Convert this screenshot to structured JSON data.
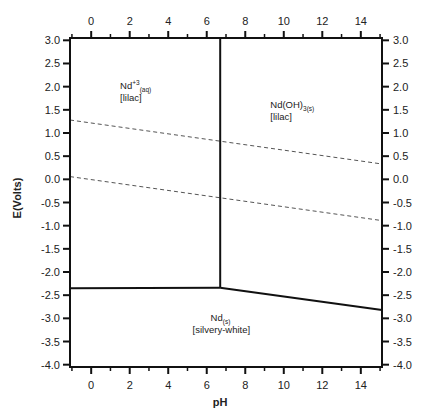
{
  "chart_data": {
    "type": "line",
    "title": "",
    "subtitle": "Pourbaix diagram for neodymium",
    "xlabel": "pH",
    "ylabel": "E(Volts)",
    "xlim": [
      -1.1,
      15.1
    ],
    "ylim": [
      -4.05,
      3.05
    ],
    "grid": false,
    "legend": null,
    "x_ticks": [
      0,
      2,
      4,
      6,
      8,
      10,
      12,
      14
    ],
    "x_tick_labels": [
      "0",
      "2",
      "4",
      "6",
      "8",
      "10",
      "12",
      "14"
    ],
    "x_minor_ticks": [
      -1,
      1,
      3,
      5,
      7,
      9,
      11,
      13,
      15
    ],
    "y_ticks": [
      3.0,
      2.5,
      2.0,
      1.5,
      1.0,
      0.5,
      0.0,
      -0.5,
      -1.0,
      -1.5,
      -2.0,
      -2.5,
      -3.0,
      -3.5,
      -4.0
    ],
    "y_tick_labels": [
      "3.0",
      "2.5",
      "2.0",
      "1.5",
      "1.0",
      "0.5",
      "0.0",
      "-0.5",
      "-1.0",
      "-1.5",
      "-2.0",
      "-2.5",
      "-3.0",
      "-3.5",
      "-4.0"
    ],
    "axes_mirrored": true,
    "series": [
      {
        "name": "O2/H2O stability limit",
        "style": "dashed",
        "color": "#555555",
        "x": [
          -1.1,
          15.1
        ],
        "y": [
          1.28,
          0.33
        ]
      },
      {
        "name": "H2O/H2 stability limit",
        "style": "dashed",
        "color": "#555555",
        "x": [
          -1.1,
          15.1
        ],
        "y": [
          0.06,
          -0.89
        ]
      },
      {
        "name": "Nd+3 / Nd(OH)3 boundary",
        "style": "solid",
        "color": "#111111",
        "x": [
          6.7,
          6.7
        ],
        "y": [
          3.05,
          -2.34
        ]
      },
      {
        "name": "Nd+3 / Nd boundary",
        "style": "solid",
        "color": "#111111",
        "x": [
          -1.1,
          6.7
        ],
        "y": [
          -2.35,
          -2.34
        ]
      },
      {
        "name": "Nd(OH)3 / Nd boundary",
        "style": "solid",
        "color": "#111111",
        "x": [
          6.7,
          15.1
        ],
        "y": [
          -2.34,
          -2.82
        ]
      }
    ],
    "annotations": [
      {
        "species": "Nd",
        "charge": "+3",
        "state": "(aq)",
        "color_label": "[lilac]",
        "x": 1.5,
        "y": 1.95
      },
      {
        "species": "Nd(OH)",
        "charge": "",
        "state": "3(s)",
        "color_label": "[lilac]",
        "x": 9.3,
        "y": 1.55
      },
      {
        "species": "Nd",
        "charge": "",
        "state": "(s)",
        "color_label": "[silvery-white]",
        "x": 6.2,
        "y": -3.05
      }
    ]
  }
}
